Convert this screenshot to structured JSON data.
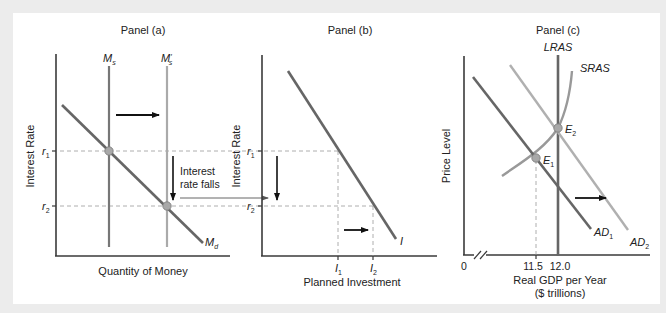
{
  "colors": {
    "background": "#ececec",
    "panel": "#ffffff",
    "axis": "#3a3a3a",
    "curve_dark": "#666666",
    "curve_light": "#a8a8a8",
    "dashed": "#9a9a9a",
    "dot": "#a0a0a0"
  },
  "panels": [
    {
      "id": "a",
      "title": "Panel (a)",
      "ylabel": "Interest Rate",
      "xlabel": "Quantity of Money",
      "ticks_y": [
        {
          "label": "r",
          "sub": "1"
        },
        {
          "label": "r",
          "sub": "2"
        }
      ],
      "curves": {
        "ms": {
          "label": "M",
          "sub": "s"
        },
        "ms_prime": {
          "label": "M",
          "sub": "s",
          "prime": "′"
        },
        "md": {
          "label": "M",
          "sub": "d"
        }
      },
      "annotation_line1": "Interest",
      "annotation_line2": "rate falls"
    },
    {
      "id": "b",
      "title": "Panel (b)",
      "ylabel": "Interest Rate",
      "xlabel": "Planned Investment",
      "ticks_y": [
        {
          "label": "r",
          "sub": "1"
        },
        {
          "label": "r",
          "sub": "2"
        }
      ],
      "ticks_x": [
        {
          "label": "I",
          "sub": "1"
        },
        {
          "label": "I",
          "sub": "2"
        }
      ],
      "curves": {
        "i": {
          "label": "I"
        }
      }
    },
    {
      "id": "c",
      "title": "Panel (c)",
      "ylabel": "Price Level",
      "xlabel_line1": "Real GDP per Year",
      "xlabel_line2": "($ trillions)",
      "origin": "0",
      "ticks_x": [
        "11.5",
        "12.0"
      ],
      "curves": {
        "lras": {
          "label": "LRAS"
        },
        "sras": {
          "label": "SRAS"
        },
        "ad1": {
          "label": "AD",
          "sub": "1"
        },
        "ad2": {
          "label": "AD",
          "sub": "2"
        }
      },
      "points": {
        "e1": {
          "label": "E",
          "sub": "1"
        },
        "e2": {
          "label": "E",
          "sub": "2"
        }
      }
    }
  ]
}
